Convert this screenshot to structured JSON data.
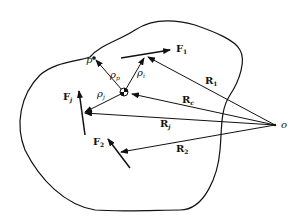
{
  "diagram": {
    "labels": {
      "origin": "o",
      "point_p": "p",
      "F1": "F",
      "F1_sub": "1",
      "Fj": "F",
      "Fj_sub": "j",
      "F2": "F",
      "F2_sub": "2",
      "R1": "R",
      "R1_sub": "1",
      "Rc": "R",
      "Rc_sub": "c",
      "Rj": "R",
      "Rj_sub": "j",
      "R2": "R",
      "R2_sub": "2",
      "rho_p": "ρ",
      "rho_p_sub": "p",
      "rho_i": "ρ",
      "rho_i_sub": "i",
      "rho_j": "ρ",
      "rho_j_sub": "j"
    },
    "colors": {
      "stroke": "#111111",
      "background": "#ffffff"
    }
  }
}
